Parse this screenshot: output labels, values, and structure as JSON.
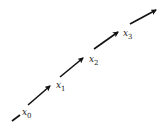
{
  "diagram": {
    "labels": [
      {
        "id": "x0",
        "var": "x",
        "sub": "0"
      },
      {
        "id": "x1",
        "var": "x",
        "sub": "1"
      },
      {
        "id": "x2",
        "var": "x",
        "sub": "2"
      },
      {
        "id": "x3",
        "var": "x",
        "sub": "3"
      }
    ],
    "arrow_count": 4,
    "stroke_color": "#111111"
  }
}
